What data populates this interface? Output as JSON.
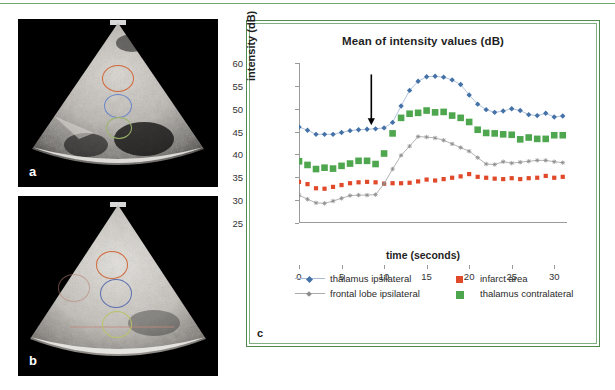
{
  "figure": {
    "panels": [
      {
        "id": "a",
        "label": "a",
        "type": "ultrasound-image",
        "name": "panel-a"
      },
      {
        "id": "b",
        "label": "b",
        "type": "ultrasound-image",
        "name": "panel-b"
      },
      {
        "id": "c",
        "label": "c",
        "type": "line-chart",
        "name": "panel-c"
      }
    ],
    "roi_colors": {
      "infarct": "#d2693c",
      "thalamus": "#5b7fc4",
      "frontal": "#9ab46a"
    },
    "border_color": "#4f8a4f"
  },
  "chart_data": {
    "type": "line",
    "title": "Mean of intensity values (dB)",
    "xlabel": "time (seconds)",
    "ylabel": "intensity (dB)",
    "xlim": [
      0,
      31.5
    ],
    "ylim": [
      25,
      60
    ],
    "yticks": [
      25,
      30,
      35,
      40,
      45,
      50,
      55,
      60
    ],
    "xticks": [
      0,
      5,
      10,
      15,
      20,
      25,
      30
    ],
    "grid": false,
    "legend_position": "bottom",
    "annotations": [
      {
        "type": "arrow",
        "x": 8.5,
        "label": "",
        "direction": "down",
        "color": "#000000"
      }
    ],
    "x": [
      0,
      1,
      2,
      3,
      4,
      5,
      6,
      7,
      8,
      9,
      10,
      11,
      12,
      13,
      14,
      15,
      16,
      17,
      18,
      19,
      20,
      21,
      22,
      23,
      24,
      25,
      26,
      27,
      28,
      29,
      30,
      31
    ],
    "series": [
      {
        "name": "thalamus ipsilateral",
        "color": "#4472a8",
        "marker": "diamond",
        "line": true,
        "values": [
          46.0,
          45.3,
          44.4,
          44.4,
          44.4,
          44.8,
          45.2,
          45.4,
          45.5,
          45.6,
          45.8,
          47.0,
          50.6,
          54.0,
          56.0,
          57.0,
          57.1,
          56.9,
          56.3,
          55.3,
          53.0,
          51.0,
          49.8,
          49.2,
          49.5,
          50.0,
          49.6,
          48.7,
          48.5,
          49.0,
          48.2,
          48.4
        ]
      },
      {
        "name": "infarct area",
        "color": "#e0492a",
        "marker": "square",
        "line": false,
        "values": [
          34.0,
          33.5,
          32.6,
          32.5,
          32.9,
          33.3,
          33.7,
          33.9,
          34.0,
          33.9,
          33.6,
          33.7,
          33.7,
          33.8,
          34.1,
          34.5,
          34.3,
          34.6,
          34.9,
          35.2,
          35.7,
          35.1,
          34.9,
          34.7,
          34.6,
          34.8,
          34.6,
          34.8,
          34.9,
          35.3,
          34.9,
          35.1
        ]
      },
      {
        "name": "frontal lobe ipsilateral",
        "color": "#8c8c8c",
        "marker": "star",
        "line": true,
        "values": [
          31.1,
          30.2,
          29.4,
          29.3,
          29.8,
          30.4,
          31.0,
          31.1,
          31.1,
          31.2,
          33.6,
          36.8,
          39.8,
          41.8,
          43.9,
          43.8,
          43.6,
          43.1,
          42.3,
          41.5,
          40.7,
          39.3,
          37.9,
          37.8,
          38.4,
          38.1,
          38.3,
          38.5,
          38.7,
          38.7,
          38.4,
          38.2
        ]
      },
      {
        "name": "thalamus contralateral",
        "color": "#4ea64e",
        "marker": "square-large",
        "line": false,
        "values": [
          38.5,
          37.7,
          36.8,
          37.1,
          36.9,
          37.5,
          38.0,
          38.6,
          38.6,
          37.9,
          40.2,
          44.6,
          48.0,
          48.9,
          49.1,
          49.6,
          49.2,
          49.3,
          48.5,
          48.0,
          47.1,
          45.4,
          44.7,
          44.6,
          44.4,
          44.3,
          43.3,
          43.7,
          43.4,
          43.4,
          44.2,
          44.2
        ]
      }
    ]
  },
  "legend": {
    "items": [
      {
        "label": "thalamus ipsilateral",
        "color": "#4472a8",
        "marker": "diamond",
        "line": true
      },
      {
        "label": "infarct area",
        "color": "#e0492a",
        "marker": "square",
        "line": false
      },
      {
        "label": "frontal lobe ipsilateral",
        "color": "#8c8c8c",
        "marker": "star",
        "line": true
      },
      {
        "label": "thalamus contralateral",
        "color": "#4ea64e",
        "marker": "square-large",
        "line": false
      }
    ]
  }
}
